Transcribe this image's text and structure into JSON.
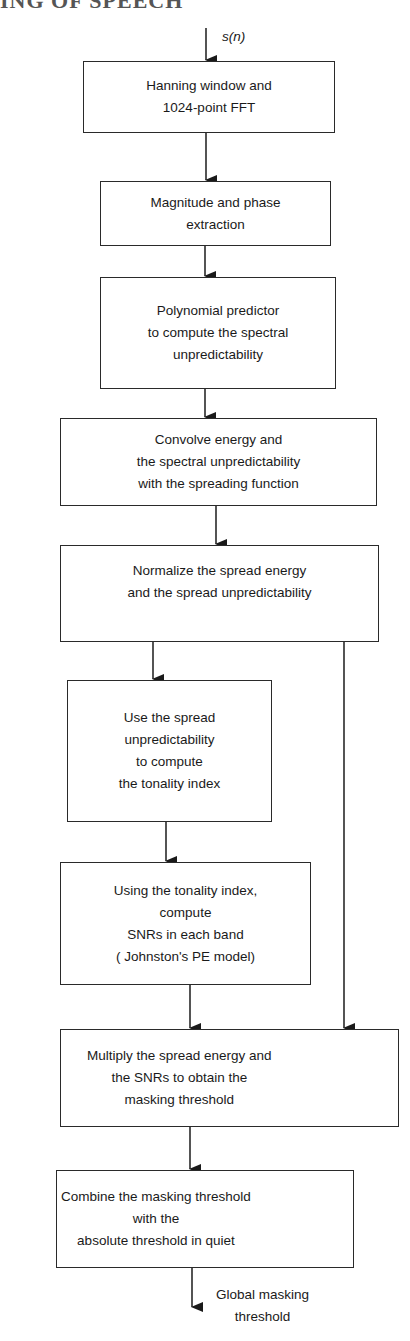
{
  "heading": "ING OF SPEECH",
  "input_label": "s(n)",
  "output_label": "Global masking\nthreshold",
  "steps": [
    {
      "id": "hanning",
      "text": "Hanning window and\n1024-point FFT"
    },
    {
      "id": "magnitude",
      "text": "Magnitude and phase\nextraction"
    },
    {
      "id": "polynomial",
      "text": "Polynomial predictor\nto compute the spectral\nunpredictability"
    },
    {
      "id": "convolve",
      "text": "Convolve energy and\nthe spectral unpredictability\nwith the spreading function"
    },
    {
      "id": "normalize",
      "text": "Normalize the spread energy\nand the spread unpredictability"
    },
    {
      "id": "tonality",
      "text": "Use the spread\nunpredictability\nto compute\nthe tonality index"
    },
    {
      "id": "snr",
      "text": "Using the tonality index,\ncompute\nSNRs in each band\n( Johnston's PE model)"
    },
    {
      "id": "multiply",
      "text": "Multiply the spread energy and\nthe SNRs to obtain the\nmasking threshold"
    },
    {
      "id": "combine",
      "text": "Combine the masking threshold\nwith the\nabsolute threshold in quiet"
    }
  ],
  "colors": {
    "line": "#2a2a2a",
    "text": "#1a1a1a",
    "background": "#ffffff"
  }
}
